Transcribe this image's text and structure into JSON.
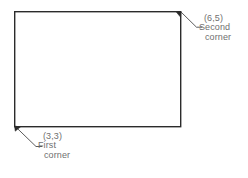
{
  "diagram": {
    "type": "cad-rectangle-corner-illustration",
    "background_color": "#ffffff",
    "line_color": "#2b2b2b",
    "text_color": "#6f6f6f",
    "rectangle": {
      "name": "rectangle-shape",
      "left": 14,
      "top": 11,
      "right": 181,
      "bottom": 127,
      "width": 167,
      "height": 116,
      "stroke_width": 1.4
    },
    "labels": [
      {
        "id": "second-corner",
        "coordinate": "(6,5)",
        "line1": "Second",
        "line2": "corner",
        "anchor_corner": "top-right",
        "leader": {
          "x1": 181,
          "y1": 12,
          "x2": 196,
          "y2": 27,
          "tick_x": 202
        }
      },
      {
        "id": "first-corner",
        "coordinate": "(3,3)",
        "line1": "First",
        "line2": "corner",
        "anchor_corner": "bottom-left",
        "leader": {
          "x1": 15,
          "y1": 126,
          "x2": 36,
          "y2": 146,
          "tick_x": 42
        }
      }
    ],
    "arrowheads": [
      {
        "at": "top-right-corner",
        "x": 181,
        "y": 12
      },
      {
        "at": "bottom-left-corner",
        "x": 15,
        "y": 126
      }
    ]
  }
}
